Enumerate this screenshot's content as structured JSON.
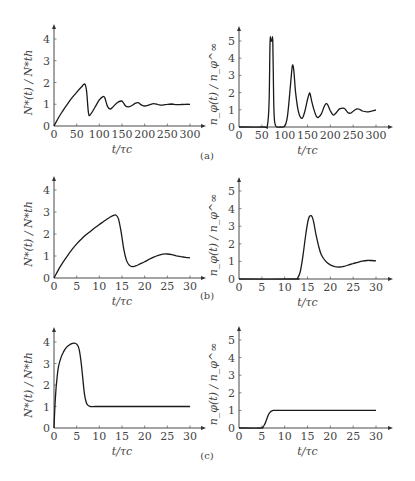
{
  "panels": [
    {
      "label": "(a)"
    },
    {
      "label": "(b)"
    },
    {
      "label": "(c)"
    }
  ],
  "chart_data": [
    {
      "type": "line",
      "panel": "(a)",
      "side": "left",
      "title": "",
      "xlabel": "t/τc",
      "ylabel": "N*(t) / N*th",
      "xlim": [
        0,
        300
      ],
      "ylim": [
        0,
        4
      ],
      "xticks": [
        0,
        50,
        100,
        150,
        200,
        250,
        300
      ],
      "yticks": [
        0,
        1,
        2,
        3,
        4
      ],
      "x": [
        0,
        10,
        20,
        30,
        40,
        50,
        60,
        68,
        72,
        76,
        80,
        90,
        100,
        108,
        112,
        118,
        124,
        130,
        140,
        148,
        152,
        158,
        164,
        170,
        180,
        186,
        192,
        200,
        210,
        220,
        230,
        240,
        250,
        260,
        270,
        280,
        290,
        300
      ],
      "values": [
        0,
        0.38,
        0.72,
        1.02,
        1.3,
        1.55,
        1.78,
        1.93,
        1.6,
        0.6,
        0.52,
        0.85,
        1.2,
        1.35,
        1.3,
        0.9,
        0.78,
        0.88,
        1.08,
        1.15,
        1.1,
        0.92,
        0.88,
        0.92,
        1.05,
        1.07,
        0.98,
        0.92,
        0.97,
        1.03,
        0.98,
        0.96,
        1.0,
        1.01,
        0.98,
        0.99,
        1.0,
        1.0
      ]
    },
    {
      "type": "line",
      "panel": "(a)",
      "side": "right",
      "title": "",
      "xlabel": "t/τc",
      "ylabel": "n_φ(t) / n_φ^∞",
      "xlim": [
        0,
        300
      ],
      "ylim": [
        0,
        5
      ],
      "xticks": [
        0,
        50,
        100,
        150,
        200,
        250,
        300
      ],
      "yticks": [
        0,
        1,
        2,
        3,
        4,
        5
      ],
      "x": [
        0,
        55,
        62,
        66,
        68,
        70,
        72,
        74,
        76,
        78,
        82,
        90,
        100,
        106,
        112,
        116,
        118,
        120,
        124,
        130,
        138,
        144,
        150,
        154,
        156,
        160,
        166,
        172,
        180,
        186,
        190,
        194,
        200,
        206,
        212,
        220,
        228,
        232,
        238,
        244,
        250,
        258,
        264,
        270,
        280,
        290,
        300
      ],
      "values": [
        0,
        0,
        0.05,
        1.5,
        5.0,
        5.0,
        5.0,
        5.0,
        1.5,
        0.3,
        0.02,
        0,
        0.05,
        0.6,
        2.2,
        3.4,
        3.6,
        3.3,
        2.0,
        0.9,
        0.5,
        0.9,
        1.6,
        1.95,
        1.9,
        1.4,
        0.85,
        0.55,
        0.75,
        1.15,
        1.35,
        1.3,
        0.95,
        0.7,
        0.8,
        1.05,
        1.1,
        1.05,
        0.85,
        0.8,
        0.92,
        1.05,
        1.03,
        0.93,
        0.88,
        0.92,
        1.0
      ]
    },
    {
      "type": "line",
      "panel": "(b)",
      "side": "left",
      "title": "",
      "xlabel": "t/τc",
      "ylabel": "N*(t) / N*th",
      "xlim": [
        0,
        30
      ],
      "ylim": [
        0,
        4
      ],
      "xticks": [
        0,
        5,
        10,
        15,
        20,
        25,
        30
      ],
      "yticks": [
        0,
        1,
        2,
        3,
        4
      ],
      "x": [
        0,
        1,
        2,
        3,
        4,
        5,
        6,
        7,
        8,
        9,
        10,
        11,
        12,
        13,
        13.6,
        14.2,
        14.8,
        15.4,
        16,
        16.6,
        17.2,
        18,
        19,
        20,
        21,
        22,
        23,
        24,
        25,
        26,
        27,
        28,
        29,
        30
      ],
      "values": [
        0,
        0.38,
        0.72,
        1.02,
        1.3,
        1.55,
        1.76,
        1.95,
        2.12,
        2.28,
        2.43,
        2.58,
        2.72,
        2.83,
        2.86,
        2.7,
        2.1,
        1.3,
        0.8,
        0.58,
        0.52,
        0.55,
        0.64,
        0.74,
        0.85,
        0.95,
        1.03,
        1.08,
        1.09,
        1.06,
        1.01,
        0.97,
        0.94,
        0.92
      ]
    },
    {
      "type": "line",
      "panel": "(b)",
      "side": "right",
      "title": "",
      "xlabel": "t/τc",
      "ylabel": "n_φ(t) / n_φ^∞",
      "xlim": [
        0,
        30
      ],
      "ylim": [
        0,
        5
      ],
      "xticks": [
        0,
        5,
        10,
        15,
        20,
        25,
        30
      ],
      "yticks": [
        0,
        1,
        2,
        3,
        4,
        5
      ],
      "x": [
        0,
        12,
        12.8,
        13.4,
        14,
        14.6,
        15.2,
        15.8,
        16.3,
        16.8,
        17.4,
        18,
        19,
        20,
        21,
        22,
        23,
        24,
        25,
        26,
        27,
        28,
        29,
        30
      ],
      "values": [
        0,
        0,
        0.05,
        0.4,
        1.3,
        2.5,
        3.4,
        3.6,
        3.3,
        2.6,
        1.9,
        1.4,
        1.0,
        0.8,
        0.7,
        0.68,
        0.72,
        0.8,
        0.88,
        0.95,
        1.01,
        1.05,
        1.05,
        1.03
      ]
    },
    {
      "type": "line",
      "panel": "(c)",
      "side": "left",
      "title": "",
      "xlabel": "t/τc",
      "ylabel": "N*(t) / N*th",
      "xlim": [
        0,
        30
      ],
      "ylim": [
        0,
        4
      ],
      "xticks": [
        0,
        5,
        10,
        15,
        20,
        25,
        30
      ],
      "yticks": [
        0,
        1,
        2,
        3,
        4
      ],
      "x": [
        0,
        0.3,
        0.7,
        1,
        1.5,
        2,
        2.5,
        3,
        3.5,
        4,
        4.5,
        5,
        5.5,
        5.9,
        6.3,
        6.7,
        7.1,
        7.5,
        8,
        9,
        10,
        15,
        20,
        25,
        30
      ],
      "values": [
        0,
        1.4,
        2.4,
        2.85,
        3.25,
        3.5,
        3.68,
        3.8,
        3.88,
        3.93,
        3.95,
        3.9,
        3.7,
        3.2,
        2.4,
        1.6,
        1.2,
        1.05,
        1.0,
        1.0,
        1.0,
        1.0,
        1.0,
        1.0,
        1.0
      ]
    },
    {
      "type": "line",
      "panel": "(c)",
      "side": "right",
      "title": "",
      "xlabel": "t/τc",
      "ylabel": "n_φ(t) / n_φ^∞",
      "xlim": [
        0,
        30
      ],
      "ylim": [
        0,
        5
      ],
      "xticks": [
        0,
        5,
        10,
        15,
        20,
        25,
        30
      ],
      "yticks": [
        0,
        1,
        2,
        3,
        4,
        5
      ],
      "x": [
        0,
        4.8,
        5.2,
        5.6,
        6,
        6.4,
        6.8,
        7.2,
        7.6,
        8,
        10,
        15,
        20,
        25,
        30
      ],
      "values": [
        0,
        0,
        0.05,
        0.2,
        0.45,
        0.72,
        0.9,
        0.98,
        1.0,
        1.0,
        1.0,
        1.0,
        1.0,
        1.0,
        1.0
      ]
    }
  ],
  "layout": {
    "plots": [
      {
        "x0": 54,
        "x1": 190,
        "y0": 126,
        "yTop": 39,
        "yTopVal": 4,
        "arrowTop": 24,
        "arrowRight": 206
      },
      {
        "x0": 239,
        "x1": 376,
        "y0": 127,
        "yTop": 41,
        "yTopVal": 5,
        "arrowTop": 26,
        "arrowRight": 393
      },
      {
        "x0": 54,
        "x1": 190,
        "y0": 278,
        "yTop": 190,
        "yTopVal": 4,
        "arrowTop": 176,
        "arrowRight": 206
      },
      {
        "x0": 239,
        "x1": 376,
        "y0": 279,
        "yTop": 191,
        "yTopVal": 5,
        "arrowTop": 177,
        "arrowRight": 393
      },
      {
        "x0": 54,
        "x1": 190,
        "y0": 428,
        "yTop": 342,
        "yTopVal": 4,
        "arrowTop": 327,
        "arrowRight": 206
      },
      {
        "x0": 239,
        "x1": 376,
        "y0": 428,
        "yTop": 340,
        "yTopVal": 5,
        "arrowTop": 326,
        "arrowRight": 393
      }
    ],
    "panelLabelY": [
      159,
      299,
      459
    ]
  }
}
